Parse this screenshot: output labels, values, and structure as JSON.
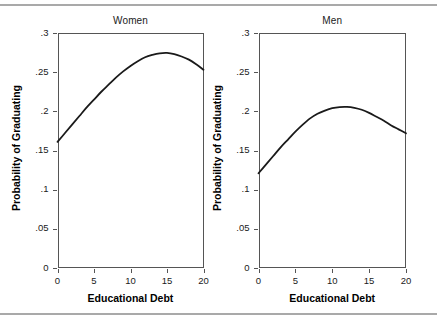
{
  "figure": {
    "background": "#ffffff",
    "rule_color": "#a9a9a9",
    "axis_color": "#555555",
    "curve_color": "#1a1a1a"
  },
  "axis_titles": {
    "y": "Probability of Graduating",
    "x_left": "Educational Debt",
    "x_right": "Educational Debt"
  },
  "panels": [
    {
      "title": "Women",
      "y_ticklabels": [
        "0",
        ".05",
        ".1",
        ".15",
        ".2",
        ".25",
        ".3"
      ],
      "x_ticklabels": [
        "0",
        "5",
        "10",
        "15",
        "20"
      ],
      "xlabel": "Educational Debt",
      "ylabel": "Probability of Graduating"
    },
    {
      "title": "Men",
      "y_ticklabels": [
        "0",
        ".05",
        ".1",
        ".15",
        ".2",
        ".25",
        ".3"
      ],
      "x_ticklabels": [
        "0",
        "5",
        "10",
        "15",
        "20"
      ],
      "xlabel": "Educational Debt",
      "ylabel": "Probability of Graduating"
    }
  ],
  "chart_data": {
    "type": "line",
    "title": "",
    "xlabel": "Educational Debt",
    "ylabel": "Probability of Graduating",
    "xlim": [
      0,
      20
    ],
    "ylim": [
      0,
      0.3
    ],
    "xticks": [
      0,
      5,
      10,
      15,
      20
    ],
    "yticks": [
      0,
      0.05,
      0.1,
      0.15,
      0.2,
      0.25,
      0.3
    ],
    "xticklabels": [
      "0",
      "5",
      "10",
      "15",
      "20"
    ],
    "yticklabels": [
      "0",
      ".05",
      ".1",
      ".15",
      ".2",
      ".25",
      ".3"
    ],
    "grid": false,
    "legend": "none",
    "panels": [
      {
        "name": "Women",
        "x": [
          0,
          1,
          2,
          3,
          4,
          5,
          6,
          7,
          8,
          9,
          10,
          11,
          12,
          13,
          14,
          15,
          16,
          17,
          18,
          19,
          20
        ],
        "y": [
          0.161,
          0.172,
          0.183,
          0.194,
          0.205,
          0.215,
          0.225,
          0.234,
          0.243,
          0.251,
          0.258,
          0.264,
          0.269,
          0.272,
          0.274,
          0.2745,
          0.273,
          0.27,
          0.266,
          0.26,
          0.253
        ],
        "peak": {
          "x": 14.8,
          "y": 0.2745
        },
        "endpoints": {
          "start": {
            "x": 0,
            "y": 0.161
          },
          "end": {
            "x": 20,
            "y": 0.253
          }
        }
      },
      {
        "name": "Men",
        "x": [
          0,
          1,
          2,
          3,
          4,
          5,
          6,
          7,
          8,
          9,
          10,
          11,
          12,
          13,
          14,
          15,
          16,
          17,
          18,
          19,
          20
        ],
        "y": [
          0.121,
          0.132,
          0.143,
          0.154,
          0.164,
          0.174,
          0.183,
          0.191,
          0.197,
          0.201,
          0.204,
          0.2055,
          0.2057,
          0.2045,
          0.202,
          0.198,
          0.193,
          0.188,
          0.182,
          0.177,
          0.172
        ],
        "peak": {
          "x": 12.1,
          "y": 0.2057
        },
        "endpoints": {
          "start": {
            "x": 0,
            "y": 0.121
          },
          "end": {
            "x": 20,
            "y": 0.172
          }
        }
      }
    ]
  }
}
